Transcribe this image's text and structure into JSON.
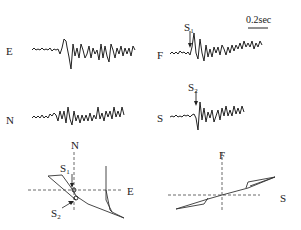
{
  "figure": {
    "scale_bar": {
      "label": "0.2sec"
    },
    "traces": [
      {
        "channel": "E",
        "position": "top-left"
      },
      {
        "channel": "N",
        "position": "middle-left"
      },
      {
        "channel": "F",
        "position": "top-right",
        "arrival": {
          "label": "S",
          "subscript": "1"
        }
      },
      {
        "channel": "S",
        "position": "middle-right",
        "arrival": {
          "label": "S",
          "subscript": "2"
        }
      }
    ],
    "particle_motion": [
      {
        "plot": "horizontal",
        "y_axis": "N",
        "x_axis": "E",
        "markers": [
          {
            "label": "S",
            "subscript": "1"
          },
          {
            "label": "S",
            "subscript": "2"
          }
        ]
      },
      {
        "plot": "rotated",
        "y_axis": "F",
        "x_axis": "S"
      }
    ]
  }
}
